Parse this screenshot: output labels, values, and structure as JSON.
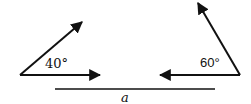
{
  "diagram": {
    "left_vector_pair": {
      "angle_label": "40°",
      "angle_deg": 40
    },
    "right_vector_pair": {
      "angle_label": "60°",
      "angle_deg": 60
    },
    "baseline_label": "a",
    "colors": {
      "stroke": "#111111",
      "background": "#ffffff"
    }
  }
}
